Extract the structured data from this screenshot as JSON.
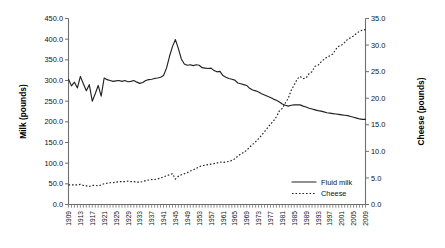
{
  "chart_data": {
    "type": "line",
    "title": "",
    "subtitle": "",
    "xlabel": "",
    "ylabel": "Milk (pounds)",
    "y2label": "Cheese (pounds)",
    "grid": false,
    "legend_position": "inside-bottom-right",
    "xlim": [
      1909,
      2009
    ],
    "ylim": [
      0,
      450
    ],
    "y2lim": [
      0,
      35
    ],
    "yticks": [
      "0.0",
      "50.0",
      "100.0",
      "150.0",
      "200.0",
      "250.0",
      "300.0",
      "350.0",
      "400.0",
      "450.0"
    ],
    "ytick_values": [
      0,
      50,
      100,
      150,
      200,
      250,
      300,
      350,
      400,
      450
    ],
    "y2ticks": [
      "0.0",
      "5.0",
      "10.0",
      "15.0",
      "20.0",
      "25.0",
      "30.0",
      "35.0"
    ],
    "y2tick_values": [
      0,
      5,
      10,
      15,
      20,
      25,
      30,
      35
    ],
    "xticks": [
      "1909",
      "1913",
      "1917",
      "1921",
      "1925",
      "1929",
      "1933",
      "1937",
      "1941",
      "1945",
      "1949",
      "1953",
      "1957",
      "1961",
      "1965",
      "1969",
      "1973",
      "1977",
      "1981",
      "1985",
      "1989",
      "1993",
      "1997",
      "2001",
      "2005",
      "2009"
    ],
    "x": [
      1909,
      1910,
      1911,
      1912,
      1913,
      1914,
      1915,
      1916,
      1917,
      1918,
      1919,
      1920,
      1921,
      1922,
      1923,
      1924,
      1925,
      1926,
      1927,
      1928,
      1929,
      1930,
      1931,
      1932,
      1933,
      1934,
      1935,
      1936,
      1937,
      1938,
      1939,
      1940,
      1941,
      1942,
      1943,
      1944,
      1945,
      1946,
      1947,
      1948,
      1949,
      1950,
      1951,
      1952,
      1953,
      1954,
      1955,
      1956,
      1957,
      1958,
      1959,
      1960,
      1961,
      1962,
      1963,
      1964,
      1965,
      1966,
      1967,
      1968,
      1969,
      1970,
      1971,
      1972,
      1973,
      1974,
      1975,
      1976,
      1977,
      1978,
      1979,
      1980,
      1981,
      1982,
      1983,
      1984,
      1985,
      1986,
      1987,
      1988,
      1989,
      1990,
      1991,
      1992,
      1993,
      1994,
      1995,
      1996,
      1997,
      1998,
      1999,
      2000,
      2001,
      2002,
      2003,
      2004,
      2005,
      2006,
      2007,
      2008,
      2009
    ],
    "series": [
      {
        "name": "Fluid milk",
        "axis": "left",
        "style": "solid",
        "color": "#222222",
        "values": [
          303,
          287,
          296,
          282,
          310,
          292,
          275,
          290,
          250,
          268,
          288,
          262,
          306,
          302,
          300,
          298,
          299,
          300,
          298,
          300,
          297,
          298,
          300,
          296,
          293,
          295,
          300,
          302,
          303,
          305,
          306,
          308,
          312,
          330,
          358,
          382,
          399,
          377,
          352,
          340,
          337,
          338,
          336,
          338,
          337,
          331,
          330,
          329,
          330,
          324,
          321,
          322,
          312,
          308,
          305,
          303,
          301,
          294,
          292,
          290,
          288,
          281,
          277,
          275,
          272,
          268,
          265,
          262,
          259,
          255,
          252,
          248,
          243,
          240,
          238,
          240,
          241,
          241,
          241,
          238,
          236,
          233,
          231,
          229,
          227,
          226,
          224,
          222,
          221,
          220,
          219,
          218,
          217,
          216,
          215,
          213,
          211,
          209,
          207,
          206,
          206
        ]
      },
      {
        "name": "Cheese",
        "axis": "right",
        "style": "dotted",
        "color": "#222222",
        "values": [
          3.7,
          3.7,
          3.7,
          3.7,
          3.8,
          3.6,
          3.5,
          3.4,
          3.6,
          3.6,
          3.5,
          3.7,
          3.9,
          4.0,
          4.1,
          4.1,
          4.2,
          4.3,
          4.3,
          4.3,
          4.4,
          4.3,
          4.3,
          4.2,
          4.2,
          4.3,
          4.5,
          4.6,
          4.7,
          4.7,
          4.8,
          5.0,
          5.2,
          5.4,
          5.6,
          5.8,
          4.8,
          5.3,
          5.6,
          5.8,
          6.0,
          6.3,
          6.5,
          6.8,
          7.1,
          7.3,
          7.4,
          7.5,
          7.6,
          7.7,
          7.8,
          8.0,
          7.9,
          8.0,
          8.1,
          8.3,
          8.6,
          9.1,
          9.5,
          9.8,
          10.2,
          10.8,
          11.3,
          11.8,
          12.4,
          13.0,
          13.7,
          14.4,
          15.1,
          15.7,
          16.5,
          17.6,
          18.1,
          19.1,
          20.0,
          21.5,
          22.5,
          23.6,
          24.1,
          23.7,
          23.8,
          24.6,
          25.0,
          26.0,
          26.2,
          26.8,
          27.3,
          27.7,
          28.0,
          28.3,
          29.2,
          29.8,
          30.0,
          30.5,
          31.1,
          31.4,
          31.7,
          32.2,
          32.6,
          32.8,
          32.9
        ]
      }
    ],
    "legend": [
      {
        "label": "Fluid milk",
        "style": "solid"
      },
      {
        "label": "Cheese",
        "style": "dotted"
      }
    ]
  }
}
